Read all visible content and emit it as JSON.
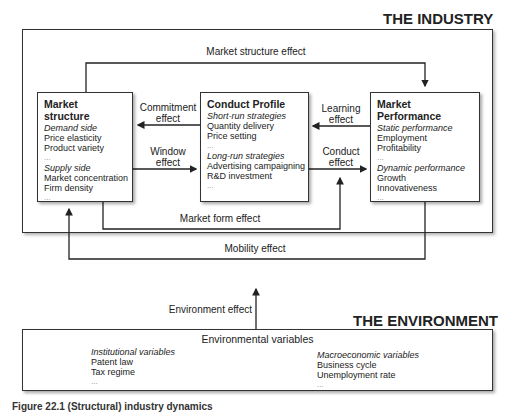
{
  "industry": {
    "title": "THE INDUSTRY",
    "market_structure": {
      "title": "Market structure",
      "demand_heading": "Demand side",
      "demand_items": [
        "Price elasticity",
        "Product variety",
        "..."
      ],
      "supply_heading": "Supply side",
      "supply_items": [
        "Market concentration",
        "Firm density",
        "..."
      ]
    },
    "conduct_profile": {
      "title": "Conduct Profile",
      "short_heading": "Short-run strategies",
      "short_items": [
        "Quantity delivery",
        "Price setting",
        "..."
      ],
      "long_heading": "Long-run strategies",
      "long_items": [
        "Advertising campaigning",
        "R&D investment",
        "..."
      ]
    },
    "market_performance": {
      "title": "Market Performance",
      "static_heading": "Static performance",
      "static_items": [
        "Employment",
        "Profitability",
        "..."
      ],
      "dynamic_heading": "Dynamic performance",
      "dynamic_items": [
        "Growth",
        "Innovativeness",
        "..."
      ]
    },
    "effects": {
      "market_structure_effect": "Market structure effect",
      "commitment_effect_1": "Commitment",
      "commitment_effect_2": "effect",
      "window_effect_1": "Window",
      "window_effect_2": "effect",
      "learning_effect_1": "Learning",
      "learning_effect_2": "effect",
      "conduct_effect_1": "Conduct",
      "conduct_effect_2": "effect",
      "market_form_effect": "Market form effect",
      "mobility_effect": "Mobility effect"
    }
  },
  "environment_effect": "Environment effect",
  "environment": {
    "title": "THE ENVIRONMENT",
    "heading": "Environmental variables",
    "institutional_heading": "Institutional variables",
    "institutional_items": [
      "Patent law",
      "Tax regime",
      "..."
    ],
    "macro_heading": "Macroeconomic variables",
    "macro_items": [
      "Business cycle",
      "Unemployment rate",
      "..."
    ]
  },
  "caption": "Figure 22.1  (Structural) industry dynamics"
}
